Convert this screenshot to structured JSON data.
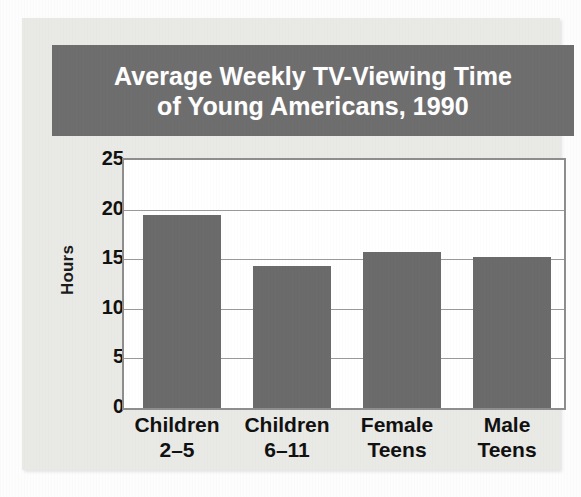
{
  "title": {
    "line1": "Average Weekly TV-Viewing Time",
    "line2": "of Young Americans, 1990"
  },
  "colors": {
    "banner_background": "#6e6e6e",
    "banner_text": "#ffffff",
    "bar_fill": "#6b6b6b",
    "card_background": "#e9e9e6",
    "plot_background": "#ffffff",
    "plot_border": "#8e8e8e",
    "gridline": "#9a9a9a",
    "axis_text": "#111111"
  },
  "chart_data": {
    "type": "bar",
    "title": "Average Weekly TV-Viewing Time of Young Americans, 1990",
    "xlabel": "",
    "ylabel": "Hours",
    "categories": [
      "Children 2–5",
      "Children 6–11",
      "Female Teens",
      "Male Teens"
    ],
    "category_lines": [
      [
        "Children",
        "2–5"
      ],
      [
        "Children",
        "6–11"
      ],
      [
        "Female",
        "Teens"
      ],
      [
        "Male",
        "Teens"
      ]
    ],
    "values": [
      19.5,
      14.3,
      15.7,
      15.2
    ],
    "ylim": [
      0,
      25
    ],
    "yticks": [
      0,
      5,
      10,
      15,
      20,
      25
    ],
    "ytick_labels": [
      "0",
      "5",
      "10",
      "15",
      "20",
      "25"
    ],
    "grid": true,
    "grid_axis": "y",
    "legend": false
  }
}
